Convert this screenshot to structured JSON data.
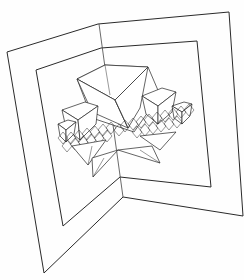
{
  "figure": {
    "subject": "fractal pop-up card line drawing",
    "stroke_color": "#2a2a2a",
    "background_color": "#fefefe",
    "outer_frame": {
      "left_panel": [
        [
          7,
          52
        ],
        [
          98,
          24
        ],
        [
          123,
          57
        ],
        [
          44,
          273
        ]
      ],
      "points": [
        [
          7,
          52
        ],
        [
          98,
          24
        ],
        [
          229,
          12
        ],
        [
          243,
          216
        ],
        [
          123,
          197
        ],
        [
          44,
          273
        ]
      ]
    },
    "inner_frame": {
      "points": [
        [
          36,
          70
        ],
        [
          101,
          48
        ],
        [
          197,
          41
        ],
        [
          211,
          187
        ],
        [
          120,
          177
        ],
        [
          63,
          226
        ]
      ]
    },
    "fold_line": [
      [
        100,
        24
      ],
      [
        123,
        197
      ]
    ],
    "central_pyramid": {
      "left": [
        77,
        79
      ],
      "top": [
        105,
        65
      ],
      "right": [
        148,
        67
      ],
      "apex": [
        115,
        100
      ]
    }
  }
}
